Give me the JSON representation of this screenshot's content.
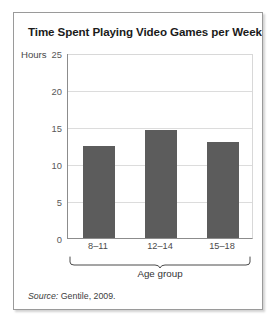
{
  "figure": {
    "title": "Time Spent Playing Video Games per Week",
    "source_label": "Source:",
    "source_text": "Gentile, 2009."
  },
  "chart_data": {
    "type": "bar",
    "title": "Time Spent Playing Video Games per Week",
    "categories": [
      "8–11",
      "12–14",
      "15–18"
    ],
    "values": [
      12.4,
      14.6,
      13.0
    ],
    "xlabel": "Age group",
    "ylabel": "Hours",
    "ylim": [
      0,
      25
    ],
    "yticks": [
      0,
      5,
      10,
      15,
      20,
      25
    ],
    "ytick_labels": [
      "0",
      "5",
      "10",
      "15",
      "20",
      "25"
    ],
    "grid": true,
    "legend": null,
    "bar_color": "#5c5c5c",
    "gridline_color": "#dcdcdc",
    "axis_color": "#8c8c8c"
  }
}
